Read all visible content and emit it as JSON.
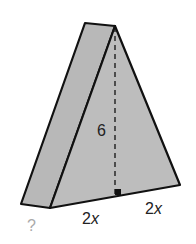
{
  "diagram": {
    "type": "triangular-prism",
    "colors": {
      "face": "#bdbdbd",
      "side": "#b8b8b8",
      "stroke": "#111111",
      "background": "#ffffff"
    },
    "labels": {
      "height": "6",
      "depth": "?",
      "base_left_num": "2",
      "base_left_var": "x",
      "base_right_num": "2",
      "base_right_var": "x"
    }
  }
}
